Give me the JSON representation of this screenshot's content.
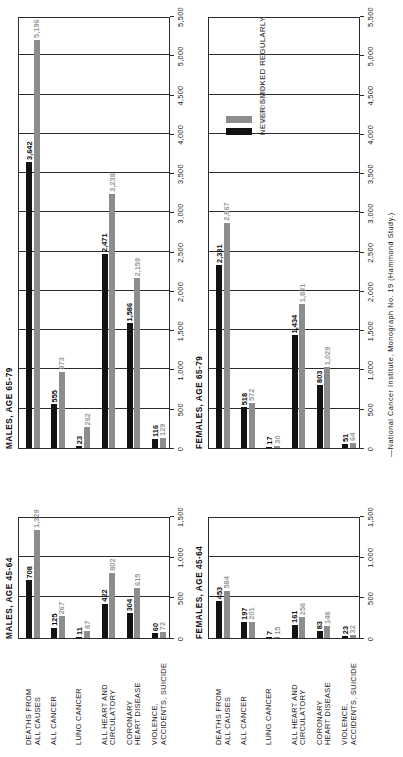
{
  "figure": {
    "caption": "—National Cancer Institute, Monograph No. 19 (Hammond Study.)",
    "legend": {
      "never_label": "NEVER SMOKED REGULARLY",
      "smoker_label": "SMOKER",
      "never_color": "#121212",
      "smoker_color": "#8d8d8d"
    },
    "categories": [
      "DEATHS FROM\nALL CAUSES",
      "ALL CANCER",
      "LUNG CANCER",
      "ALL HEART AND\nCIRCULATORY",
      "CORONARY\nHEART DISEASE",
      "VIOLENCE,\nACCIDENTS, SUICIDE"
    ]
  },
  "chart_data": [
    {
      "id": "males-45-64",
      "type": "bar",
      "title": "MALES, AGE 45-64",
      "orientation": "horizontal",
      "categories": [
        "DEATHS FROM ALL CAUSES",
        "ALL CANCER",
        "LUNG CANCER",
        "ALL HEART AND CIRCULATORY",
        "CORONARY HEART DISEASE",
        "VIOLENCE, ACCIDENTS, SUICIDE"
      ],
      "series": [
        {
          "name": "NEVER SMOKED REGULARLY",
          "values": [
            708,
            125,
            11,
            422,
            304,
            60
          ]
        },
        {
          "name": "SMOKER",
          "values": [
            1329,
            267,
            87,
            802,
            615,
            72
          ]
        }
      ],
      "xlim": [
        0,
        1500
      ],
      "xticks": [
        0,
        500,
        1000,
        1500
      ],
      "xticklabels": [
        "0",
        "500",
        "1,000",
        "1,500"
      ],
      "xlabel": "",
      "ylabel": "",
      "grid": true,
      "legend_position": "none"
    },
    {
      "id": "males-65-79",
      "type": "bar",
      "title": "MALES, AGE 65-79",
      "orientation": "horizontal",
      "categories": [
        "DEATHS FROM ALL CAUSES",
        "ALL CANCER",
        "LUNG CANCER",
        "ALL HEART AND CIRCULATORY",
        "CORONARY HEART DISEASE",
        "VIOLENCE, ACCIDENTS, SUICIDE"
      ],
      "series": [
        {
          "name": "NEVER SMOKED REGULARLY",
          "values": [
            3642,
            555,
            23,
            2471,
            1586,
            116
          ]
        },
        {
          "name": "SMOKER",
          "values": [
            5196,
            973,
            262,
            3238,
            2159,
            129
          ]
        }
      ],
      "xlim": [
        0,
        5500
      ],
      "xticks": [
        0,
        500,
        1000,
        1500,
        2000,
        2500,
        3000,
        3500,
        4000,
        4500,
        5000,
        5500
      ],
      "xticklabels": [
        "0",
        "500",
        "1,000",
        "1,500",
        "2,000",
        "2,500",
        "3,000",
        "3,500",
        "4,000",
        "4,500",
        "5,000",
        "5,500"
      ],
      "xlabel": "",
      "ylabel": "",
      "grid": true,
      "legend_position": "none"
    },
    {
      "id": "females-45-64",
      "type": "bar",
      "title": "FEMALES, AGE 45-64",
      "orientation": "horizontal",
      "categories": [
        "DEATHS FROM ALL CAUSES",
        "ALL CANCER",
        "LUNG CANCER",
        "ALL HEART AND CIRCULATORY",
        "CORONARY HEART DISEASE",
        "VIOLENCE, ACCIDENTS, SUICIDE"
      ],
      "series": [
        {
          "name": "NEVER SMOKED REGULARLY",
          "values": [
            453,
            197,
            7,
            161,
            83,
            23
          ]
        },
        {
          "name": "SMOKER",
          "values": [
            584,
            201,
            15,
            256,
            148,
            32
          ]
        }
      ],
      "xlim": [
        0,
        1500
      ],
      "xticks": [
        0,
        500,
        1000,
        1500
      ],
      "xticklabels": [
        "0",
        "500",
        "1,000",
        "1,500"
      ],
      "xlabel": "",
      "ylabel": "",
      "grid": true,
      "legend_position": "none"
    },
    {
      "id": "females-65-79",
      "type": "bar",
      "title": "FEMALES, AGE 65-79",
      "orientation": "horizontal",
      "categories": [
        "DEATHS FROM ALL CAUSES",
        "ALL CANCER",
        "LUNG CANCER",
        "ALL HEART AND CIRCULATORY",
        "CORONARY HEART DISEASE",
        "VIOLENCE, ACCIDENTS, SUICIDE"
      ],
      "series": [
        {
          "name": "NEVER SMOKED REGULARLY",
          "values": [
            2331,
            518,
            17,
            1434,
            803,
            51
          ]
        },
        {
          "name": "SMOKER",
          "values": [
            2867,
            572,
            30,
            1831,
            1029,
            64
          ]
        }
      ],
      "xlim": [
        0,
        5500
      ],
      "xticks": [
        0,
        500,
        1000,
        1500,
        2000,
        2500,
        3000,
        3500,
        4000,
        4500,
        5000,
        5500
      ],
      "xticklabels": [
        "0",
        "500",
        "1,000",
        "1,500",
        "2,000",
        "2,500",
        "3,000",
        "3,500",
        "4,000",
        "4,500",
        "5,000",
        "5,500"
      ],
      "xlabel": "",
      "ylabel": "",
      "grid": true,
      "legend_position": "bottom-right"
    }
  ]
}
